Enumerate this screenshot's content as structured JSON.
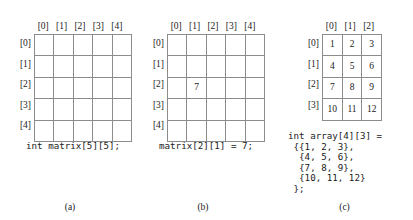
{
  "figure": {
    "panels": [
      {
        "id": "a",
        "letter": "(a)",
        "col_headers": [
          "[0]",
          "[1]",
          "[2]",
          "[3]",
          "[4]"
        ],
        "row_headers": [
          "[0]",
          "[1]",
          "[2]",
          "[3]",
          "[4]"
        ],
        "rows": 5,
        "cols": 5,
        "cells": [
          [
            "",
            "",
            "",
            "",
            ""
          ],
          [
            "",
            "",
            "",
            "",
            ""
          ],
          [
            "",
            "",
            "",
            "",
            ""
          ],
          [
            "",
            "",
            "",
            "",
            ""
          ],
          [
            "",
            "",
            "",
            "",
            ""
          ]
        ],
        "code": "int matrix[5][5];"
      },
      {
        "id": "b",
        "letter": "(b)",
        "col_headers": [
          "[0]",
          "[1]",
          "[2]",
          "[3]",
          "[4]"
        ],
        "row_headers": [
          "[0]",
          "[1]",
          "[2]",
          "[3]",
          "[4]"
        ],
        "rows": 5,
        "cols": 5,
        "cells": [
          [
            "",
            "",
            "",
            "",
            ""
          ],
          [
            "",
            "",
            "",
            "",
            ""
          ],
          [
            "",
            "7",
            "",
            "",
            ""
          ],
          [
            "",
            "",
            "",
            "",
            ""
          ],
          [
            "",
            "",
            "",
            "",
            ""
          ]
        ],
        "code": "matrix[2][1] = 7;"
      },
      {
        "id": "c",
        "letter": "(c)",
        "col_headers": [
          "[0]",
          "[1]",
          "[2]"
        ],
        "row_headers": [
          "[0]",
          "[1]",
          "[2]",
          "[3]"
        ],
        "rows": 4,
        "cols": 3,
        "cells": [
          [
            "1",
            "2",
            "3"
          ],
          [
            "4",
            "5",
            "6"
          ],
          [
            "7",
            "8",
            "9"
          ],
          [
            "10",
            "11",
            "12"
          ]
        ],
        "code": "int array[4][3] =\n {{1, 2, 3},\n  {4, 5, 6},\n  {7, 8, 9},\n  {10, 11, 12}\n };"
      }
    ],
    "colors": {
      "grid_line": "#8c8c8c",
      "text": "#1a1a1a",
      "background": "#ffffff"
    }
  }
}
